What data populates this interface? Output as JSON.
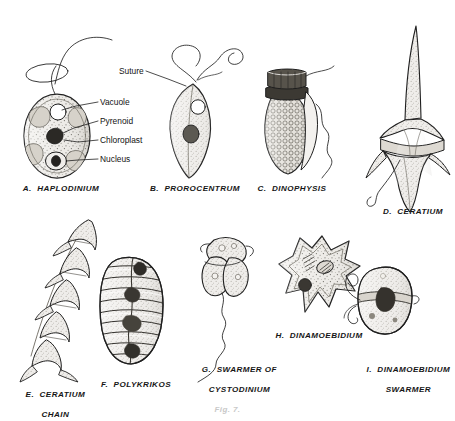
{
  "plate": {
    "title": "Dinoflagellate plate",
    "footer_caption": "Fig. 7.",
    "ink_color": "#1f1f1f",
    "fill_light": "#e8e6e2",
    "fill_mid": "#cfcbc4",
    "fill_dark": "#4a4742"
  },
  "callouts": {
    "suture": "Suture",
    "vacuole": "Vacuole",
    "pyrenoid": "Pyrenoid",
    "chloroplast": "Chloroplast",
    "nucleus": "Nucleus"
  },
  "specimens": [
    {
      "key": "a",
      "letter": "A.",
      "name": "HAPLODINIUM",
      "caption": "A.  HAPLODINIUM"
    },
    {
      "key": "b",
      "letter": "B.",
      "name": "PROROCENTRUM",
      "caption": "B.  PROROCENTRUM"
    },
    {
      "key": "c",
      "letter": "C.",
      "name": "DINOPHYSIS",
      "caption": "C.  DINOPHYSIS"
    },
    {
      "key": "d",
      "letter": "D.",
      "name": "CERATIUM",
      "caption": "D.  CERATIUM"
    },
    {
      "key": "e",
      "letter": "E.",
      "name": "CERATIUM CHAIN",
      "caption_line1": "E.  CERATIUM",
      "caption_line2": "CHAIN"
    },
    {
      "key": "f",
      "letter": "F.",
      "name": "POLYKRIKOS",
      "caption": "F.  POLYKRIKOS"
    },
    {
      "key": "g",
      "letter": "G.",
      "name": "SWARMER OF CYSTODINIUM",
      "caption_line1": "G.  SWARMER OF",
      "caption_line2": "CYSTODINIUM"
    },
    {
      "key": "h",
      "letter": "H.",
      "name": "DINAMOEBIDIUM",
      "caption": "H.  DINAMOEBIDIUM"
    },
    {
      "key": "i",
      "letter": "I.",
      "name": "DINAMOEBIDIUM SWARMER",
      "caption_line1": "I.  DINAMOEBIDIUM",
      "caption_line2": "SWARMER"
    }
  ]
}
